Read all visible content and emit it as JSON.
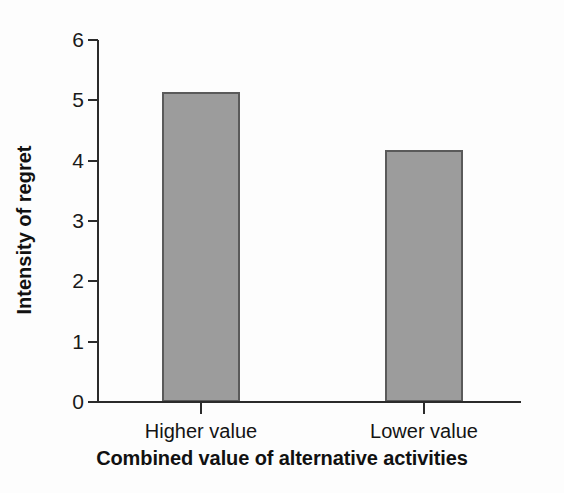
{
  "chart_data": {
    "type": "bar",
    "title": "",
    "xlabel": "Combined value of alternative activities",
    "ylabel": "Intensity of regret",
    "categories": [
      "Higher value",
      "Lower value"
    ],
    "values": [
      5.14,
      4.18
    ],
    "ylim": [
      0,
      6
    ],
    "yticks": [
      0,
      1,
      2,
      3,
      4,
      5,
      6
    ],
    "ytick_labels": [
      "0",
      "1",
      "2",
      "3",
      "4",
      "5",
      "6"
    ],
    "grid": false,
    "legend": "none",
    "bar_fill_color": "#9c9c9c",
    "bar_edge_color": "#5a5a5a",
    "axis_color": "#2b2b2b",
    "background_color": "#fdfdfd"
  }
}
